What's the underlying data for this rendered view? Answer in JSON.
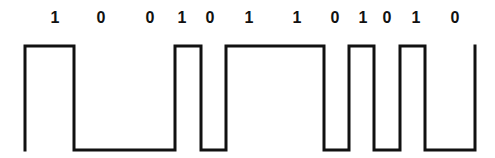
{
  "diagram": {
    "type": "digital-signal-waveform",
    "bits": [
      "1",
      "0",
      "0",
      "1",
      "0",
      "1",
      "1",
      "0",
      "1",
      "0",
      "1",
      "0"
    ],
    "labels": [
      {
        "text": "1",
        "x": 55
      },
      {
        "text": "0",
        "x": 101
      },
      {
        "text": "0",
        "x": 150
      },
      {
        "text": "1",
        "x": 182
      },
      {
        "text": "0",
        "x": 210
      },
      {
        "text": "1",
        "x": 249
      },
      {
        "text": "1",
        "x": 297
      },
      {
        "text": "0",
        "x": 335
      },
      {
        "text": "1",
        "x": 363
      },
      {
        "text": "0",
        "x": 387
      },
      {
        "text": "1",
        "x": 416
      },
      {
        "text": "0",
        "x": 455
      }
    ],
    "waveform": {
      "high_y": 46,
      "low_y": 150,
      "stroke_color": "#111111",
      "stroke_width": 3,
      "points": "25,150 25,46 74,46 74,150 175,150 175,46 201,46 201,150 226,150 226,46 324,46 324,150 349,150 349,46 374,46 374,150 400,150 400,46 425,46 425,150 475,150 475,46"
    }
  }
}
